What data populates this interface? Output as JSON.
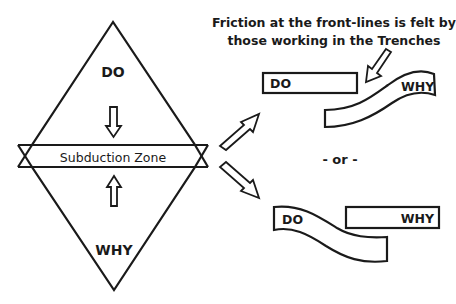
{
  "diagram": {
    "left": {
      "top_triangle_label": "DO",
      "bottom_triangle_label": "WHY",
      "band_label": "Subduction Zone"
    },
    "caption": {
      "line1": "Friction at the front-lines is felt by",
      "line2": "those working in the Trenches"
    },
    "scenario_top": {
      "do_label": "DO",
      "why_label": "WHY"
    },
    "separator": "- or -",
    "scenario_bottom": {
      "do_label": "DO",
      "why_label": "WHY"
    },
    "colors": {
      "stroke": "#1a1a1a",
      "background": "#ffffff"
    }
  }
}
